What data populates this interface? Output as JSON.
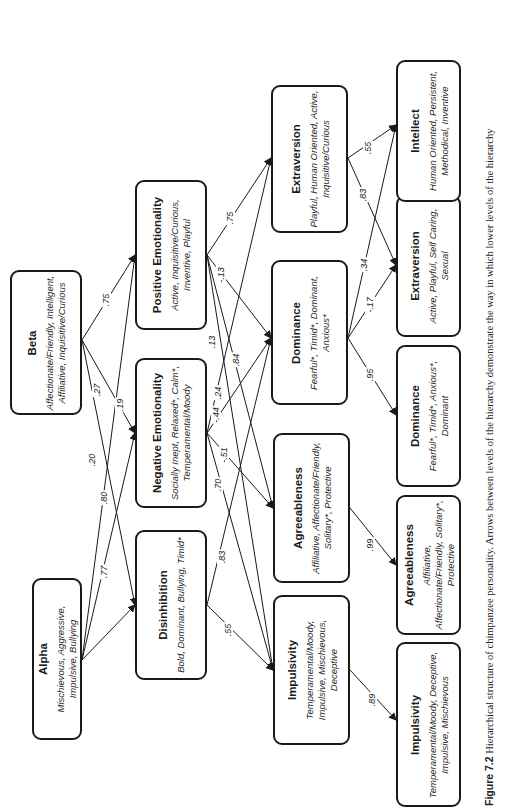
{
  "figure": {
    "caption_label": "Figure 7.2",
    "caption_text": " Hierarchical structure of chimpanzee personality. Arrows between levels of the hierarchy demonstrate the way in which lower levels of the hierarchy",
    "orientation": "rotated 90° counter-clockwise"
  },
  "levels": {
    "level1": [
      {
        "id": "alpha",
        "title": "Alpha",
        "desc": "Mischievous, Aggressive, Impulsive, Bullying",
        "box": [
          32,
          578,
          50,
          162
        ]
      },
      {
        "id": "beta",
        "title": "Beta",
        "desc": "Affectionate/Friendly, Intelligent, Affiliative, Inquisitive/Curious",
        "box": [
          10,
          270,
          72,
          145
        ]
      }
    ],
    "level2": [
      {
        "id": "disinhibition",
        "title": "Disinhibition",
        "desc": "Bold, Dominant, Bullying, Timid*",
        "box": [
          135,
          530,
          72,
          150
        ]
      },
      {
        "id": "neg_emo",
        "title": "Negative Emotionality",
        "desc": "Socially Inept, Relaxed*, Calm*, Temperamental/Moody",
        "box": [
          135,
          358,
          72,
          150
        ]
      },
      {
        "id": "pos_emo",
        "title": "Positive Emotionality",
        "desc": "Active, Inquisitive/Curious, Inventive, Playful",
        "box": [
          135,
          180,
          72,
          150
        ]
      }
    ],
    "level3": [
      {
        "id": "impulsivity3",
        "title": "Impulsivity",
        "desc": "Temperamental/Moody, Impulsive, Mischievous, Deceptive",
        "box": [
          273,
          595,
          77,
          150
        ]
      },
      {
        "id": "agreeableness3",
        "title": "Agreeableness",
        "desc": "Affiliative, Affectionate/Friendly, Solitary*, Protective",
        "box": [
          273,
          433,
          77,
          150
        ]
      },
      {
        "id": "dominance3",
        "title": "Dominance",
        "desc": "Fearful*, Timid*, Dominant, Anxious*",
        "box": [
          271,
          260,
          77,
          145
        ]
      },
      {
        "id": "extraversion3",
        "title": "Extraversion",
        "desc": "Playful, Human Oriented, Active, Inquisitive/Curious",
        "box": [
          271,
          85,
          77,
          148
        ]
      }
    ],
    "level4": [
      {
        "id": "impulsivity4",
        "title": "Impulsivity",
        "desc": "Temperamental/Moody, Deceptive, Impulsive, Mischievous",
        "box": [
          396,
          642,
          65,
          165
        ]
      },
      {
        "id": "agreeableness4",
        "title": "Agreeableness",
        "desc": "Affiliative, Affectionate/Friendly, Solitary*, Protective",
        "box": [
          396,
          495,
          65,
          140
        ]
      },
      {
        "id": "dominance4",
        "title": "Dominance",
        "desc": "Fearful*, Timid*, Anxious*, Dominant",
        "box": [
          396,
          345,
          65,
          142
        ]
      },
      {
        "id": "extraversion4",
        "title": "Extraversion",
        "desc": "Active, Playful, Self Caring, Sexual",
        "box": [
          396,
          195,
          65,
          142
        ]
      },
      {
        "id": "intellect4",
        "title": "Intellect",
        "desc": "Human Oriented, Persistent, Methodical, Inventive",
        "box": [
          396,
          60,
          65,
          142
        ]
      }
    ]
  },
  "edges": [
    {
      "from": "beta",
      "to": "pos_emo",
      "weight": ".75",
      "x1": 82,
      "y1": 340,
      "x2": 135,
      "y2": 255,
      "lx": 106,
      "ly": 300
    },
    {
      "from": "beta",
      "to": "neg_emo",
      "weight": ".19",
      "x1": 82,
      "y1": 340,
      "x2": 135,
      "y2": 433,
      "lx": 120,
      "ly": 405
    },
    {
      "from": "beta",
      "to": "disinhibition",
      "weight": ".27",
      "x1": 82,
      "y1": 340,
      "x2": 135,
      "y2": 605,
      "lx": 97,
      "ly": 390
    },
    {
      "from": "alpha",
      "to": "pos_emo",
      "weight": ".20",
      "x1": 82,
      "y1": 660,
      "x2": 135,
      "y2": 255,
      "lx": 92,
      "ly": 460
    },
    {
      "from": "alpha",
      "to": "neg_emo",
      "weight": ".80",
      "x1": 82,
      "y1": 660,
      "x2": 135,
      "y2": 433,
      "lx": 104,
      "ly": 498
    },
    {
      "from": "alpha",
      "to": "disinhibition",
      "weight": ".77",
      "x1": 82,
      "y1": 660,
      "x2": 135,
      "y2": 605,
      "lx": 104,
      "ly": 572
    },
    {
      "from": "pos_emo",
      "to": "extraversion3",
      "weight": ".75",
      "x1": 207,
      "y1": 255,
      "x2": 271,
      "y2": 158,
      "lx": 230,
      "ly": 218
    },
    {
      "from": "pos_emo",
      "to": "dominance3",
      "weight": "-.13",
      "x1": 207,
      "y1": 255,
      "x2": 271,
      "y2": 338,
      "lx": 221,
      "ly": 275
    },
    {
      "from": "pos_emo",
      "to": "agreeableness3",
      "weight": ".13",
      "x1": 207,
      "y1": 255,
      "x2": 273,
      "y2": 508,
      "lx": 212,
      "ly": 342
    },
    {
      "from": "pos_emo",
      "to": "impulsivity3",
      "weight": ".84",
      "x1": 207,
      "y1": 255,
      "x2": 273,
      "y2": 670,
      "lx": 236,
      "ly": 360
    },
    {
      "from": "neg_emo",
      "to": "extraversion3",
      "weight": ".24",
      "x1": 207,
      "y1": 433,
      "x2": 271,
      "y2": 158,
      "lx": 218,
      "ly": 393
    },
    {
      "from": "neg_emo",
      "to": "dominance3",
      "weight": "-.44",
      "x1": 207,
      "y1": 433,
      "x2": 271,
      "y2": 338,
      "lx": 216,
      "ly": 415
    },
    {
      "from": "neg_emo",
      "to": "agreeableness3",
      "weight": "-.51",
      "x1": 207,
      "y1": 433,
      "x2": 273,
      "y2": 508,
      "lx": 224,
      "ly": 455
    },
    {
      "from": "neg_emo",
      "to": "impulsivity3",
      "weight": ".70",
      "x1": 207,
      "y1": 433,
      "x2": 273,
      "y2": 670,
      "lx": 218,
      "ly": 485
    },
    {
      "from": "disinhibition",
      "to": "dominance3",
      "weight": ".83",
      "x1": 207,
      "y1": 605,
      "x2": 271,
      "y2": 338,
      "lx": 222,
      "ly": 557
    },
    {
      "from": "disinhibition",
      "to": "impulsivity3",
      "weight": ".55",
      "x1": 207,
      "y1": 605,
      "x2": 273,
      "y2": 670,
      "lx": 228,
      "ly": 630
    },
    {
      "from": "extraversion3",
      "to": "intellect4",
      "weight": ".55",
      "x1": 348,
      "y1": 158,
      "x2": 396,
      "y2": 125,
      "lx": 368,
      "ly": 148
    },
    {
      "from": "extraversion3",
      "to": "extraversion4",
      "weight": ".83",
      "x1": 348,
      "y1": 158,
      "x2": 396,
      "y2": 265,
      "lx": 363,
      "ly": 195
    },
    {
      "from": "dominance3",
      "to": "intellect4",
      "weight": ".34",
      "x1": 348,
      "y1": 338,
      "x2": 396,
      "y2": 125,
      "lx": 364,
      "ly": 265
    },
    {
      "from": "dominance3",
      "to": "extraversion4",
      "weight": "-.17",
      "x1": 348,
      "y1": 338,
      "x2": 396,
      "y2": 265,
      "lx": 370,
      "ly": 305
    },
    {
      "from": "dominance3",
      "to": "dominance4",
      "weight": ".95",
      "x1": 348,
      "y1": 338,
      "x2": 396,
      "y2": 415,
      "lx": 370,
      "ly": 375
    },
    {
      "from": "agreeableness3",
      "to": "agreeableness4",
      "weight": ".99",
      "x1": 350,
      "y1": 508,
      "x2": 396,
      "y2": 565,
      "lx": 370,
      "ly": 545
    },
    {
      "from": "impulsivity3",
      "to": "impulsivity4",
      "weight": ".89",
      "x1": 350,
      "y1": 670,
      "x2": 396,
      "y2": 720,
      "lx": 372,
      "ly": 700
    }
  ],
  "colors": {
    "stroke": "#1a1a1a",
    "background": "#ffffff",
    "text": "#1a1a1a"
  }
}
